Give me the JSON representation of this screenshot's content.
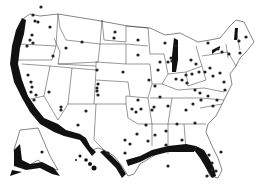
{
  "map": {
    "type": "choropleth-free site map",
    "region": "United States (contiguous, Alaska, Hawaii)",
    "colors": {
      "background": "#ffffff",
      "state_fill": "#ffffff",
      "border": "#333333",
      "coastline_highlight": "#111111",
      "site_marker": "#222222"
    },
    "highlighted_coastlines": [
      "Pacific coast",
      "Gulf coast",
      "Florida",
      "Alaska south coast",
      "Hawaii",
      "Great Lakes (Lake Michigan)",
      "Maine coast"
    ],
    "sites": [
      [
        41,
        7
      ],
      [
        33,
        15
      ],
      [
        35,
        21
      ],
      [
        38,
        22
      ],
      [
        50,
        27
      ],
      [
        32,
        35
      ],
      [
        30,
        40
      ],
      [
        33,
        43
      ],
      [
        27,
        46
      ],
      [
        82,
        42
      ],
      [
        114,
        38
      ],
      [
        66,
        48
      ],
      [
        97,
        70
      ],
      [
        53,
        56
      ],
      [
        28,
        75
      ],
      [
        31,
        82
      ],
      [
        32,
        87
      ],
      [
        31,
        92
      ],
      [
        36,
        95
      ],
      [
        34,
        100
      ],
      [
        49,
        92
      ],
      [
        61,
        107
      ],
      [
        61,
        110
      ],
      [
        115,
        32
      ],
      [
        138,
        40
      ],
      [
        138,
        55
      ],
      [
        123,
        72
      ],
      [
        98,
        84
      ],
      [
        97,
        88
      ],
      [
        97,
        91
      ],
      [
        98,
        95
      ],
      [
        86,
        111
      ],
      [
        165,
        43
      ],
      [
        176,
        46
      ],
      [
        171,
        58
      ],
      [
        172,
        61
      ],
      [
        158,
        70
      ],
      [
        149,
        80
      ],
      [
        155,
        86
      ],
      [
        160,
        97
      ],
      [
        152,
        110
      ],
      [
        138,
        100
      ],
      [
        208,
        43
      ],
      [
        218,
        49
      ],
      [
        222,
        52
      ],
      [
        229,
        54
      ],
      [
        240,
        53
      ],
      [
        239,
        41
      ],
      [
        246,
        37
      ],
      [
        160,
        62
      ],
      [
        168,
        62
      ],
      [
        191,
        60
      ],
      [
        196,
        64
      ],
      [
        199,
        72
      ],
      [
        186,
        75
      ],
      [
        192,
        74
      ],
      [
        205,
        72
      ],
      [
        210,
        68
      ],
      [
        213,
        76
      ],
      [
        220,
        73
      ],
      [
        224,
        82
      ],
      [
        225,
        90
      ],
      [
        176,
        79
      ],
      [
        182,
        80
      ],
      [
        187,
        83
      ],
      [
        195,
        90
      ],
      [
        200,
        93
      ],
      [
        217,
        100
      ],
      [
        213,
        106
      ],
      [
        208,
        96
      ],
      [
        201,
        100
      ],
      [
        132,
        109
      ],
      [
        136,
        112
      ],
      [
        141,
        109
      ],
      [
        154,
        107
      ],
      [
        168,
        106
      ],
      [
        186,
        110
      ],
      [
        193,
        104
      ],
      [
        195,
        123
      ],
      [
        177,
        124
      ],
      [
        166,
        131
      ],
      [
        146,
        125
      ],
      [
        155,
        135
      ],
      [
        148,
        141
      ],
      [
        137,
        134
      ],
      [
        130,
        144
      ],
      [
        166,
        145
      ],
      [
        182,
        140
      ],
      [
        125,
        140
      ],
      [
        125,
        153
      ],
      [
        108,
        153
      ],
      [
        168,
        166
      ],
      [
        209,
        155
      ],
      [
        212,
        163
      ],
      [
        216,
        171
      ],
      [
        207,
        176
      ],
      [
        212,
        170
      ],
      [
        221,
        152
      ],
      [
        78,
        125
      ],
      [
        42,
        152
      ]
    ]
  }
}
